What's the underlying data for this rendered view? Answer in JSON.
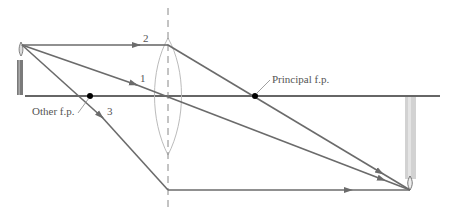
{
  "diagram": {
    "labels": {
      "ray1": "1",
      "ray2": "2",
      "ray3": "3",
      "principal_fp": "Principal f.p.",
      "other_fp": "Other f.p."
    },
    "colors": {
      "ray": "#6b6b6b",
      "axis": "#333333",
      "lens": "#bbbbbb",
      "focal_point": "#000000",
      "image_candle": "#c8c8c8",
      "object_candle": "#777777"
    }
  }
}
